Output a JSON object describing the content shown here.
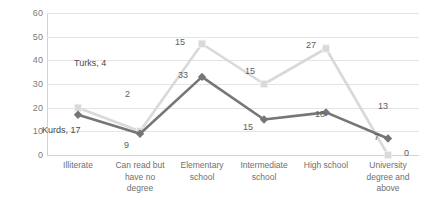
{
  "chart_data": {
    "type": "line",
    "title": "",
    "xlabel": "",
    "ylabel": "",
    "ylim": [
      0,
      60
    ],
    "yticks": [
      "0",
      "10",
      "20",
      "30",
      "40",
      "50",
      "60"
    ],
    "grid": true,
    "legend": "inline-annotations",
    "categories": [
      "Illiterate",
      "Can read but have no degree",
      "Elementary school",
      "Intermediate school",
      "High school",
      "University degree and above"
    ],
    "series": [
      {
        "name": "Turks",
        "color": "#d9d9d9",
        "marker": "square",
        "values": [
          20,
          10,
          47,
          30,
          45,
          0
        ],
        "labels": [
          "4",
          "2",
          "15",
          "15",
          "27",
          "13"
        ],
        "end_label": "0"
      },
      {
        "name": "Kurds",
        "color": "#767676",
        "marker": "diamond",
        "values": [
          17,
          9,
          33,
          15,
          18,
          7
        ],
        "labels": [
          "17",
          "9",
          "33",
          "15",
          "18",
          "7"
        ]
      }
    ]
  },
  "axis": {
    "y_ticks": [
      "60",
      "50",
      "40",
      "30",
      "20",
      "10",
      "0"
    ],
    "x_categories": [
      {
        "line1": "Illiterate",
        "line2": "",
        "line3": ""
      },
      {
        "line1": "Can read but",
        "line2": "have no",
        "line3": "degree"
      },
      {
        "line1": "Elementary",
        "line2": "school",
        "line3": ""
      },
      {
        "line1": "Intermediate",
        "line2": "school",
        "line3": ""
      },
      {
        "line1": "High school",
        "line2": "",
        "line3": ""
      },
      {
        "line1": "University",
        "line2": "degree and",
        "line3": "above"
      }
    ]
  },
  "annotations": {
    "turks_legend": "Turks, 4",
    "kurds_legend": "Kurds, 17",
    "light_labels": {
      "can_read": "2",
      "elementary": "15",
      "intermediate": "15",
      "high_school": "27",
      "university_mid": "13",
      "university_end": "0"
    },
    "dark_labels": {
      "can_read": "9",
      "elementary": "33",
      "intermediate": "15",
      "high_school": "18",
      "university": "7"
    }
  },
  "colors": {
    "light_series": "#d9d9d9",
    "dark_series": "#767676",
    "gridline": "#e4e4e4",
    "axis": "#d3d3d3",
    "tick_text": "#7b7b7b",
    "label_text": "#5d5d5d",
    "background": "#ffffff"
  }
}
